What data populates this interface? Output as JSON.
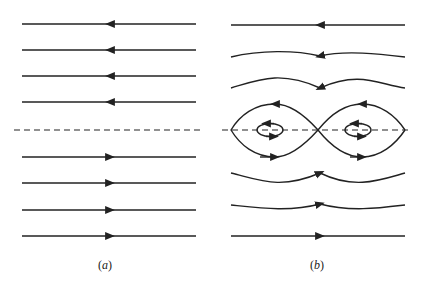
{
  "panels": [
    {
      "id": "a",
      "label": "(a)",
      "label_letter": "a",
      "description": "uniform shear flow streamlines"
    },
    {
      "id": "b",
      "label": "(b)",
      "label_letter": "b",
      "description": "cat's eye streamlines with separatrix"
    }
  ],
  "colors": {
    "stroke": "#222222",
    "background": "#ffffff"
  }
}
